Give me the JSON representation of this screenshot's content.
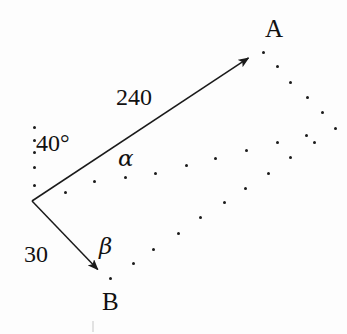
{
  "figure": {
    "width": 347,
    "height": 334,
    "background_color": "#fdfdfd",
    "ink_color": "#1a1a1a"
  },
  "labels": {
    "point_a": "A",
    "point_b": "B",
    "magnitude_a": "240",
    "magnitude_b": "30",
    "angle_from_vertical": "40°",
    "alpha": "α",
    "beta": "β"
  },
  "geometry": {
    "origin": {
      "x": 32,
      "y": 201
    },
    "vector_a": {
      "name": "vector-to-a",
      "tip": {
        "x": 256,
        "y": 53
      },
      "magnitude": "240",
      "label": "A"
    },
    "vector_b": {
      "name": "vector-to-b",
      "tip": {
        "x": 104,
        "y": 276
      },
      "magnitude": "30",
      "label": "B"
    },
    "angle_marks": [
      {
        "name": "angle-40-degrees",
        "text": "40°"
      },
      {
        "name": "angle-alpha",
        "text": "α"
      },
      {
        "name": "angle-beta",
        "text": "β"
      }
    ]
  },
  "label_positions": {
    "point_a": {
      "left": 265,
      "top": 16
    },
    "point_b": {
      "left": 102,
      "top": 289
    },
    "magnitude_a": {
      "left": 116,
      "top": 85
    },
    "magnitude_b": {
      "left": 24,
      "top": 242
    },
    "angle_40": {
      "left": 36,
      "top": 131
    },
    "alpha": {
      "left": 118,
      "top": 147
    },
    "beta": {
      "left": 99,
      "top": 235
    }
  },
  "specks": [
    {
      "x": 33,
      "y": 126
    },
    {
      "x": 33,
      "y": 139
    },
    {
      "x": 33,
      "y": 151
    },
    {
      "x": 33,
      "y": 166
    },
    {
      "x": 33,
      "y": 184
    },
    {
      "x": 64,
      "y": 191
    },
    {
      "x": 93,
      "y": 180
    },
    {
      "x": 124,
      "y": 176
    },
    {
      "x": 154,
      "y": 172
    },
    {
      "x": 185,
      "y": 164
    },
    {
      "x": 214,
      "y": 157
    },
    {
      "x": 245,
      "y": 149
    },
    {
      "x": 267,
      "y": 172
    },
    {
      "x": 244,
      "y": 187
    },
    {
      "x": 223,
      "y": 201
    },
    {
      "x": 199,
      "y": 216
    },
    {
      "x": 177,
      "y": 232
    },
    {
      "x": 152,
      "y": 248
    },
    {
      "x": 132,
      "y": 262
    },
    {
      "x": 109,
      "y": 277
    },
    {
      "x": 262,
      "y": 51
    },
    {
      "x": 276,
      "y": 65
    },
    {
      "x": 289,
      "y": 81
    },
    {
      "x": 306,
      "y": 96
    },
    {
      "x": 321,
      "y": 111
    },
    {
      "x": 334,
      "y": 127
    },
    {
      "x": 305,
      "y": 134
    },
    {
      "x": 313,
      "y": 141
    },
    {
      "x": 276,
      "y": 141
    },
    {
      "x": 289,
      "y": 156
    }
  ],
  "faint_marks": [
    {
      "x": 92,
      "y": 321
    }
  ]
}
